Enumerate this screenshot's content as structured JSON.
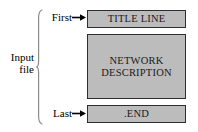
{
  "diagram": {
    "bracket_label": {
      "line1": "Input",
      "line2": "file"
    },
    "row_labels": {
      "first": "First",
      "last": "Last"
    },
    "boxes": [
      {
        "id": "title-line",
        "text": "TITLE LINE"
      },
      {
        "id": "network-description",
        "line1": "NETWORK",
        "line2": "DESCRIPTION"
      },
      {
        "id": "end-statement",
        "text": ".END"
      }
    ],
    "colors": {
      "box_fill": "#bcbcbc",
      "box_border": "#2e2e2e",
      "background": "#ffffff",
      "text": "#000000",
      "brace": "#8c8c8c"
    }
  }
}
